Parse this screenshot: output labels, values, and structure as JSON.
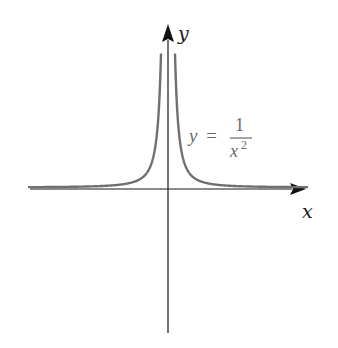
{
  "chart_data": {
    "type": "line",
    "title": "",
    "function": "y = 1/x^2",
    "xlabel": "x",
    "ylabel": "y",
    "annotation": {
      "lhs": "y =",
      "numerator": "1",
      "denominator": "x",
      "exponent": "2"
    },
    "grid": false,
    "legend": null,
    "series": [
      {
        "name": "y = 1/x^2",
        "color": "#707070",
        "x": [
          -4,
          -3,
          -2,
          -1.5,
          -1,
          -0.75,
          -0.5,
          -0.4,
          -0.3,
          -0.25,
          0.25,
          0.3,
          0.4,
          0.5,
          0.75,
          1,
          1.5,
          2,
          3,
          4
        ],
        "values": [
          0.0625,
          0.111,
          0.25,
          0.444,
          1,
          1.778,
          4,
          6.25,
          11.11,
          16,
          16,
          11.11,
          6.25,
          4,
          1.778,
          1,
          0.444,
          0.25,
          0.111,
          0.0625
        ]
      }
    ],
    "axis_color": "#1a1a1a",
    "curve_color": "#707070"
  }
}
